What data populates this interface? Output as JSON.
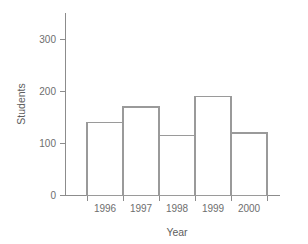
{
  "chart_data": {
    "type": "bar",
    "title": "",
    "subtitle": "",
    "xlabel": "Year",
    "ylabel": "Students",
    "categories": [
      "1996",
      "1997",
      "1998",
      "1999",
      "2000"
    ],
    "values": [
      140,
      170,
      115,
      190,
      120
    ],
    "series": [
      {
        "name": "Students",
        "values": [
          140,
          170,
          115,
          190,
          120
        ]
      }
    ],
    "ylim": [
      0,
      350
    ],
    "yticks": [
      0,
      100,
      200,
      300
    ],
    "ytick_labels": [
      "0",
      "100",
      "200",
      "300"
    ],
    "xtick_labels": [
      "1996",
      "1997",
      "1998",
      "1999",
      "2000"
    ],
    "grid": false,
    "legend": false,
    "legend_position": "none",
    "annotations": [],
    "colors": {
      "bar_fill": "#ffffff",
      "bar_stroke": "#9a9a9a",
      "axis": "#8c8c8c",
      "text": "#6e6e6e",
      "background": "#ffffff"
    }
  },
  "axes": {
    "y_title": "Students",
    "x_title": "Year",
    "y_tick_0": "0",
    "y_tick_1": "100",
    "y_tick_2": "200",
    "y_tick_3": "300",
    "x_tick_0": "1996",
    "x_tick_1": "1997",
    "x_tick_2": "1998",
    "x_tick_3": "1999",
    "x_tick_4": "2000"
  }
}
